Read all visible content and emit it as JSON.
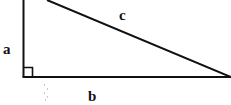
{
  "diagram": {
    "type": "right-triangle",
    "labels": {
      "vertical_leg": "a",
      "horizontal_leg": "b",
      "hypotenuse": "c"
    },
    "right_angle_marker": true,
    "colors": {
      "stroke": "#111111",
      "background": "#ffffff",
      "artifact": "#c8c8c8"
    }
  }
}
